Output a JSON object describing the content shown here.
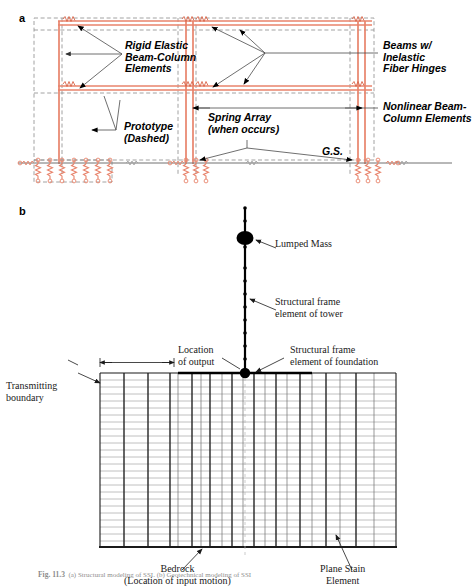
{
  "figure": {
    "caption_bold": "Fig. 11.3",
    "caption_rest": "  (a) Structural modeling of SSI. (b) Geotechnical modeling of SSI"
  },
  "panel_a": {
    "letter": "a",
    "labels": {
      "rigid_elastic": "Rigid Elastic\nBeam-Column\nElements",
      "beams_hinges": "Beams w/\nInelastic\nFiber Hinges",
      "nonlinear": "Nonlinear Beam-\nColumn Elements",
      "prototype": "Prototype\n(Dashed)",
      "spring_array": "Spring Array\n(when occurs)",
      "ground_surface": "G.S."
    },
    "colors": {
      "frame": "#e8836b",
      "frame_dark": "#d9654a",
      "dashed_prototype": "#8a8a8a",
      "leader": "#555555",
      "ground_line": "#707070"
    }
  },
  "panel_b": {
    "letter": "b",
    "labels": {
      "lumped_mass": "Lumped Mass",
      "frame_tower": "Structural frame\nelement of tower",
      "frame_foundation": "Structural frame\nelement of foundation",
      "location_output": "Location\nof output",
      "transmitting": "Transmitting\nboundary",
      "bedrock": "Bedrock\n(Location of input motion)",
      "plane_strain": "Plane Stain\nElement"
    },
    "colors": {
      "mesh_thin": "#8e8e8e",
      "mesh_bold": "#1a1a1a",
      "structure": "#000000",
      "leader": "#1a1a1a"
    }
  }
}
